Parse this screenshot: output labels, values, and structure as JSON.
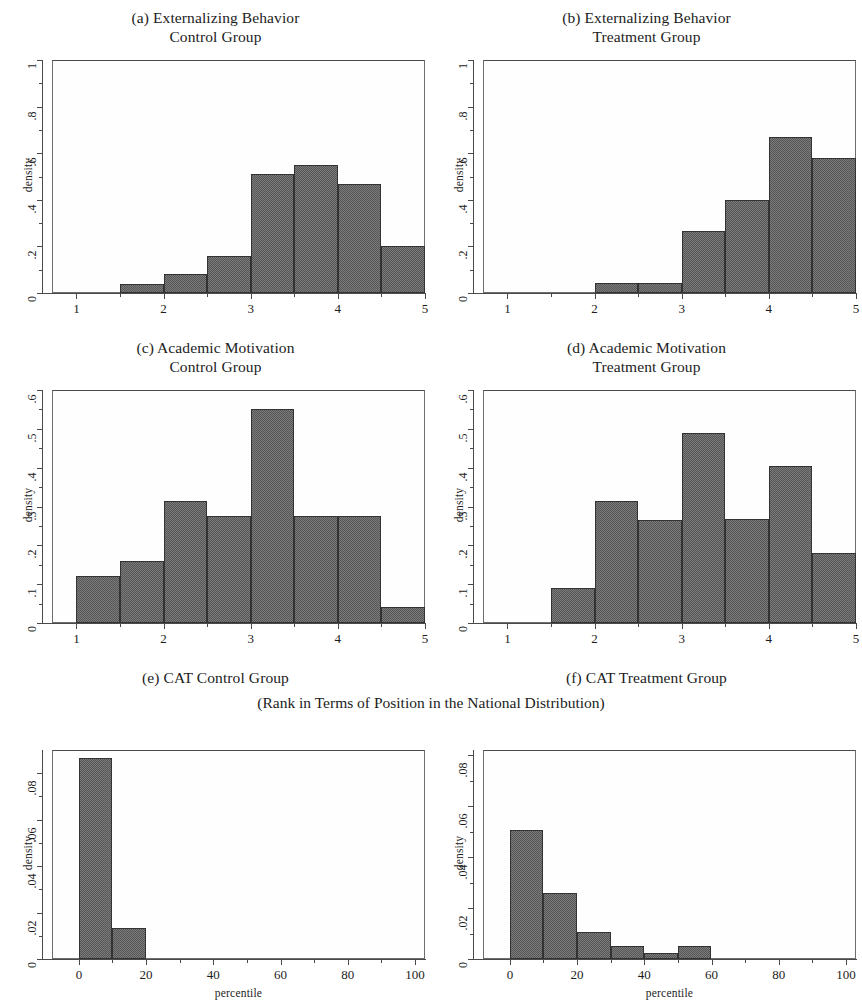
{
  "figure": {
    "width": 862,
    "height": 1001,
    "background": "#ffffff",
    "bar_fill": "#565656",
    "bar_edge": "#333333",
    "axis_color": "#4a4a4a",
    "shared_subtitle": "(Rank in Terms of Position in the National Distribution)"
  },
  "chart_data": [
    {
      "id": "a",
      "type": "bar",
      "title": "(a) Externalizing Behavior",
      "subtitle": "Control Group",
      "xlabel": "",
      "ylabel": "density",
      "xlim": [
        0.72,
        5.0
      ],
      "ylim": [
        0,
        1.0
      ],
      "bin_width": 0.5,
      "xticks": [
        1,
        2,
        3,
        4,
        5
      ],
      "xtick_labels": [
        "1",
        "2",
        "3",
        "4",
        "5"
      ],
      "yticks": [
        0,
        0.2,
        0.4,
        0.6,
        0.8,
        1.0
      ],
      "ytick_labels": [
        "0",
        ".2",
        ".4",
        ".6",
        ".8",
        "1"
      ],
      "bins": [
        {
          "x0": 1.5,
          "x1": 2.0,
          "value": 0.04
        },
        {
          "x0": 2.0,
          "x1": 2.5,
          "value": 0.08
        },
        {
          "x0": 2.5,
          "x1": 3.0,
          "value": 0.16
        },
        {
          "x0": 3.0,
          "x1": 3.5,
          "value": 0.51
        },
        {
          "x0": 3.5,
          "x1": 4.0,
          "value": 0.55
        },
        {
          "x0": 4.0,
          "x1": 4.5,
          "value": 0.47
        },
        {
          "x0": 4.5,
          "x1": 5.0,
          "value": 0.2
        }
      ]
    },
    {
      "id": "b",
      "type": "bar",
      "title": "(b) Externalizing Behavior",
      "subtitle": "Treatment Group",
      "xlabel": "",
      "ylabel": "density",
      "xlim": [
        0.72,
        5.0
      ],
      "ylim": [
        0,
        1.0
      ],
      "bin_width": 0.5,
      "xticks": [
        1,
        2,
        3,
        4,
        5
      ],
      "xtick_labels": [
        "1",
        "2",
        "3",
        "4",
        "5"
      ],
      "yticks": [
        0,
        0.2,
        0.4,
        0.6,
        0.8,
        1.0
      ],
      "ytick_labels": [
        "0",
        ".2",
        ".4",
        ".6",
        ".8",
        "1"
      ],
      "bins": [
        {
          "x0": 2.0,
          "x1": 2.5,
          "value": 0.045
        },
        {
          "x0": 2.5,
          "x1": 3.0,
          "value": 0.045
        },
        {
          "x0": 3.0,
          "x1": 3.5,
          "value": 0.265
        },
        {
          "x0": 3.5,
          "x1": 4.0,
          "value": 0.4
        },
        {
          "x0": 4.0,
          "x1": 4.5,
          "value": 0.67
        },
        {
          "x0": 4.5,
          "x1": 5.0,
          "value": 0.58
        }
      ]
    },
    {
      "id": "c",
      "type": "bar",
      "title": "(c) Academic Motivation",
      "subtitle": "Control Group",
      "xlabel": "",
      "ylabel": "density",
      "xlim": [
        0.72,
        5.0
      ],
      "ylim": [
        0,
        0.6
      ],
      "bin_width": 0.5,
      "xticks": [
        1,
        2,
        3,
        4,
        5
      ],
      "xtick_labels": [
        "1",
        "2",
        "3",
        "4",
        "5"
      ],
      "yticks": [
        0,
        0.1,
        0.2,
        0.3,
        0.4,
        0.5,
        0.6
      ],
      "ytick_labels": [
        "0",
        ".1",
        ".2",
        ".3",
        ".4",
        ".5",
        ".6"
      ],
      "bins": [
        {
          "x0": 1.0,
          "x1": 1.5,
          "value": 0.12
        },
        {
          "x0": 1.5,
          "x1": 2.0,
          "value": 0.16
        },
        {
          "x0": 2.0,
          "x1": 2.5,
          "value": 0.315
        },
        {
          "x0": 2.5,
          "x1": 3.0,
          "value": 0.275
        },
        {
          "x0": 3.0,
          "x1": 3.5,
          "value": 0.55
        },
        {
          "x0": 3.5,
          "x1": 4.0,
          "value": 0.275
        },
        {
          "x0": 4.0,
          "x1": 4.5,
          "value": 0.275
        },
        {
          "x0": 4.5,
          "x1": 5.0,
          "value": 0.04
        }
      ]
    },
    {
      "id": "d",
      "type": "bar",
      "title": "(d) Academic Motivation",
      "subtitle": "Treatment Group",
      "xlabel": "",
      "ylabel": "density",
      "xlim": [
        0.72,
        5.0
      ],
      "ylim": [
        0,
        0.6
      ],
      "bin_width": 0.5,
      "xticks": [
        1,
        2,
        3,
        4,
        5
      ],
      "xtick_labels": [
        "1",
        "2",
        "3",
        "4",
        "5"
      ],
      "yticks": [
        0,
        0.1,
        0.2,
        0.3,
        0.4,
        0.5,
        0.6
      ],
      "ytick_labels": [
        "0",
        ".1",
        ".2",
        ".3",
        ".4",
        ".5",
        ".6"
      ],
      "bins": [
        {
          "x0": 1.5,
          "x1": 2.0,
          "value": 0.09
        },
        {
          "x0": 2.0,
          "x1": 2.5,
          "value": 0.313
        },
        {
          "x0": 2.5,
          "x1": 3.0,
          "value": 0.266
        },
        {
          "x0": 3.0,
          "x1": 3.5,
          "value": 0.49
        },
        {
          "x0": 3.5,
          "x1": 4.0,
          "value": 0.268
        },
        {
          "x0": 4.0,
          "x1": 4.5,
          "value": 0.404
        },
        {
          "x0": 4.5,
          "x1": 5.0,
          "value": 0.18
        }
      ]
    },
    {
      "id": "e",
      "type": "bar",
      "title": "(e) CAT Control Group",
      "subtitle": "",
      "xlabel": "percentile",
      "ylabel": "density",
      "xlim": [
        -8,
        103
      ],
      "ylim": [
        0,
        0.09
      ],
      "bin_width": 10,
      "xticks": [
        0,
        20,
        40,
        60,
        80,
        100
      ],
      "xtick_labels": [
        "0",
        "20",
        "40",
        "60",
        "80",
        "100"
      ],
      "yticks": [
        0,
        0.02,
        0.04,
        0.06,
        0.08
      ],
      "ytick_labels": [
        "0",
        ".02",
        ".04",
        ".06",
        ".08"
      ],
      "bins": [
        {
          "x0": 0,
          "x1": 10,
          "value": 0.0865
        },
        {
          "x0": 10,
          "x1": 20,
          "value": 0.0135
        }
      ]
    },
    {
      "id": "f",
      "type": "bar",
      "title": "(f) CAT Treatment Group",
      "subtitle": "",
      "xlabel": "percentile",
      "ylabel": "density",
      "xlim": [
        -8,
        103
      ],
      "ylim": [
        0,
        0.082
      ],
      "bin_width": 10,
      "xticks": [
        0,
        20,
        40,
        60,
        80,
        100
      ],
      "xtick_labels": [
        "0",
        "20",
        "40",
        "60",
        "80",
        "100"
      ],
      "yticks": [
        0,
        0.02,
        0.04,
        0.06,
        0.08
      ],
      "ytick_labels": [
        "0",
        ".02",
        ".04",
        ".06",
        ".08"
      ],
      "bins": [
        {
          "x0": 0,
          "x1": 10,
          "value": 0.0505
        },
        {
          "x0": 10,
          "x1": 20,
          "value": 0.0258
        },
        {
          "x0": 20,
          "x1": 30,
          "value": 0.0105
        },
        {
          "x0": 30,
          "x1": 40,
          "value": 0.005
        },
        {
          "x0": 40,
          "x1": 50,
          "value": 0.0024
        },
        {
          "x0": 50,
          "x1": 60,
          "value": 0.005
        }
      ]
    }
  ],
  "layout": {
    "panels": [
      {
        "id": "a",
        "left": 0,
        "top": 8,
        "width": 431,
        "height": 322,
        "plot": {
          "left": 52,
          "top": 52,
          "width": 373,
          "height": 233
        }
      },
      {
        "id": "b",
        "left": 431,
        "top": 8,
        "width": 431,
        "height": 322,
        "plot": {
          "left": 52,
          "top": 52,
          "width": 373,
          "height": 233
        }
      },
      {
        "id": "c",
        "left": 0,
        "top": 338,
        "width": 431,
        "height": 322,
        "plot": {
          "left": 52,
          "top": 52,
          "width": 373,
          "height": 233
        }
      },
      {
        "id": "d",
        "left": 431,
        "top": 338,
        "width": 431,
        "height": 322,
        "plot": {
          "left": 52,
          "top": 52,
          "width": 373,
          "height": 233
        }
      },
      {
        "id": "e",
        "left": 0,
        "top": 668,
        "width": 431,
        "height": 333,
        "plot": {
          "left": 52,
          "top": 82,
          "width": 373,
          "height": 209
        }
      },
      {
        "id": "f",
        "left": 431,
        "top": 668,
        "width": 431,
        "height": 333,
        "plot": {
          "left": 52,
          "top": 82,
          "width": 373,
          "height": 209
        }
      }
    ],
    "subtitle_top": 694
  }
}
